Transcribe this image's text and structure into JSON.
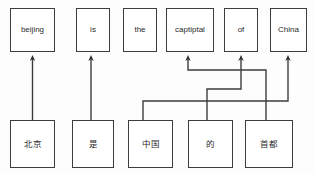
{
  "diagram": {
    "stroke_color": "#3d3d3d",
    "background_color": "#fdfdfd",
    "box_fill": "#ffffff",
    "text_color": "#2b2b2b"
  },
  "target_row": {
    "name": "english-target-row",
    "nodes": [
      {
        "id": "t0",
        "label": "beijing",
        "x": 10,
        "y": 8,
        "w": 45,
        "h": 44
      },
      {
        "id": "t1",
        "label": "is",
        "x": 76,
        "y": 8,
        "w": 34,
        "h": 44
      },
      {
        "id": "t2",
        "label": "the",
        "x": 123,
        "y": 8,
        "w": 34,
        "h": 44
      },
      {
        "id": "t3",
        "label": "captiptal",
        "x": 166,
        "y": 8,
        "w": 48,
        "h": 44
      },
      {
        "id": "t4",
        "label": "of",
        "x": 224,
        "y": 8,
        "w": 34,
        "h": 44
      },
      {
        "id": "t5",
        "label": "China",
        "x": 270,
        "y": 8,
        "w": 37,
        "h": 44
      }
    ]
  },
  "source_row": {
    "name": "chinese-source-row",
    "nodes": [
      {
        "id": "s0",
        "label": "北京",
        "x": 10,
        "y": 120,
        "w": 45,
        "h": 48
      },
      {
        "id": "s1",
        "label": "是",
        "x": 72,
        "y": 120,
        "w": 42,
        "h": 48
      },
      {
        "id": "s2",
        "label": "中国",
        "x": 128,
        "y": 120,
        "w": 45,
        "h": 48
      },
      {
        "id": "s3",
        "label": "的",
        "x": 188,
        "y": 120,
        "w": 45,
        "h": 48
      },
      {
        "id": "s4",
        "label": "首都",
        "x": 245,
        "y": 120,
        "w": 48,
        "h": 48
      }
    ]
  },
  "alignments": [
    {
      "name": "link-beijing",
      "from": "s0",
      "to": "t0",
      "kind": "straight",
      "path": "M 32.5 120 L 32.5 58"
    },
    {
      "name": "link-is",
      "from": "s1",
      "to": "t1",
      "kind": "straight",
      "path": "M 91 120 L 91 58"
    },
    {
      "name": "link-china",
      "from": "s2",
      "to": "t5",
      "kind": "routed",
      "path": "M 143 120 L 143 101 L 288 101 L 288 58"
    },
    {
      "name": "link-of",
      "from": "s3",
      "to": "t4",
      "kind": "routed",
      "path": "M 207 120 L 207 89 L 241 89 L 241 58"
    },
    {
      "name": "link-capital",
      "from": "s4",
      "to": "t3",
      "kind": "routed",
      "path": "M 266 120 L 266 70 L 188 70 L 188 58"
    }
  ],
  "legend": {
    "arrow_direction": "source-to-target",
    "arrowhead": "filled-triangle"
  }
}
